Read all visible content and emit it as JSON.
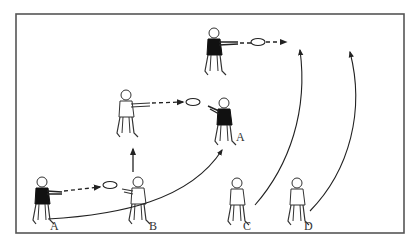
{
  "diagram": {
    "type": "sports-drill",
    "colors": {
      "ink": "#222222",
      "border": "#555555",
      "background": "#ffffff",
      "jersey_dark": "#111111"
    },
    "frame": {
      "x": 16,
      "y": 14,
      "width": 388,
      "height": 219
    },
    "players": [
      {
        "id": "A_start",
        "label": "A",
        "x": 42,
        "y": 176,
        "jersey": "dark",
        "pose": "throwing"
      },
      {
        "id": "B_start",
        "label": "B",
        "x": 136,
        "y": 176,
        "jersey": "light",
        "pose": "catching"
      },
      {
        "id": "B_mid",
        "label": "",
        "x": 126,
        "y": 92,
        "jersey": "light",
        "pose": "throwing"
      },
      {
        "id": "A_mid",
        "label": "A",
        "x": 220,
        "y": 98,
        "jersey": "dark",
        "pose": "catching"
      },
      {
        "id": "top_thrower",
        "label": "",
        "x": 215,
        "y": 30,
        "jersey": "dark",
        "pose": "throwing"
      },
      {
        "id": "C",
        "label": "C",
        "x": 236,
        "y": 176,
        "jersey": "light",
        "pose": "standing"
      },
      {
        "id": "D",
        "label": "D",
        "x": 296,
        "y": 176,
        "jersey": "light",
        "pose": "standing"
      }
    ],
    "labels": [
      {
        "text": "A",
        "x": 50,
        "y": 226
      },
      {
        "text": "B",
        "x": 149,
        "y": 226
      },
      {
        "text": "A",
        "x": 236,
        "y": 137
      },
      {
        "text": "C",
        "x": 243,
        "y": 226
      },
      {
        "text": "D",
        "x": 304,
        "y": 226
      }
    ],
    "passes": [
      {
        "from": "A_start",
        "to": "B_start",
        "style": "dashed-arrow-with-disc"
      },
      {
        "from": "B_mid",
        "to": "A_mid",
        "style": "dashed-arrow-with-disc"
      },
      {
        "from": "top_thrower",
        "to": "offscreen-right",
        "style": "dashed-arrow-with-disc"
      }
    ],
    "runs": [
      {
        "from": "B_start",
        "to": "B_mid",
        "style": "straight-arrow-up"
      },
      {
        "from": "A_start",
        "to": "A_mid",
        "style": "curved-arrow"
      },
      {
        "from": "C",
        "to": "upfield",
        "style": "curved-arrow"
      },
      {
        "from": "D",
        "to": "upfield",
        "style": "curved-arrow"
      }
    ]
  }
}
